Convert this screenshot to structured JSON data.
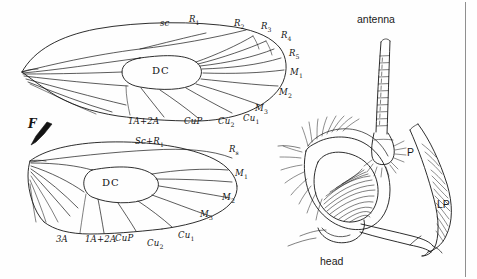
{
  "figure": {
    "title_hidden": "",
    "background_color": "#fefefe",
    "ink_color": "#161616",
    "divider_color": "#8a8a8a"
  },
  "panels": {
    "left": {
      "name": "wing-venation-panel"
    },
    "right": {
      "name": "head-panel"
    }
  },
  "forewing": {
    "cell_label": "DC",
    "labels_top": [
      {
        "text": "sc",
        "sub": ""
      },
      {
        "text": "R",
        "sub": "1"
      },
      {
        "text": "R",
        "sub": "2"
      },
      {
        "text": "R",
        "sub": "3"
      },
      {
        "text": "R",
        "sub": "4"
      },
      {
        "text": "R",
        "sub": "5"
      },
      {
        "text": "M",
        "sub": "1"
      },
      {
        "text": "M",
        "sub": "2"
      },
      {
        "text": "M",
        "sub": "3"
      }
    ],
    "labels_bottom": [
      {
        "text": "1A+2A",
        "sub": ""
      },
      {
        "text": "CuP",
        "sub": ""
      },
      {
        "text": "Cu",
        "sub": "2"
      },
      {
        "text": "Cu",
        "sub": "1"
      }
    ]
  },
  "hindwing": {
    "cell_label": "DC",
    "costal_label": {
      "text": "Sc+R",
      "sub": "1"
    },
    "fold_marker": "F",
    "labels_right": [
      {
        "text": "R",
        "sub": "s"
      },
      {
        "text": "M",
        "sub": "1"
      },
      {
        "text": "M",
        "sub": "2"
      },
      {
        "text": "M",
        "sub": "3"
      }
    ],
    "labels_bottom": [
      {
        "text": "3A",
        "sub": ""
      },
      {
        "text": "1A+2A",
        "sub": ""
      },
      {
        "text": "CuP",
        "sub": ""
      },
      {
        "text": "Cu",
        "sub": "2"
      },
      {
        "text": "Cu",
        "sub": "1"
      }
    ]
  },
  "head": {
    "antenna_label": "antenna",
    "head_label": "head",
    "palp_label": "P",
    "labial_palp_label": "LP"
  }
}
